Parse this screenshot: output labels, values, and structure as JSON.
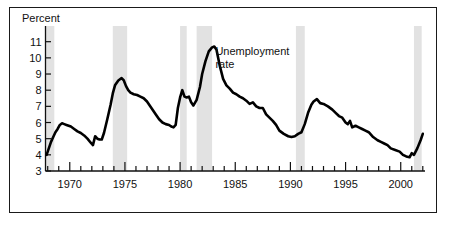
{
  "figure": {
    "background_color": "#ffffff",
    "frame_color": "#1a1a1a"
  },
  "chart_data": {
    "type": "line",
    "title": "",
    "subtitle": "",
    "xlabel": "",
    "ylabel": "Percent",
    "ylabel_position": "top-left",
    "xlim": [
      1967.8,
      2002.2
    ],
    "ylim": [
      3,
      11.6
    ],
    "grid": false,
    "legend": "none",
    "line_color": "#000000",
    "line_width_px": 2.6,
    "yticks": [
      3,
      4,
      5,
      6,
      7,
      8,
      9,
      10,
      11
    ],
    "ytick_labels": [
      "3",
      "4",
      "5",
      "6",
      "7",
      "8",
      "9",
      "10",
      "11"
    ],
    "xtick_major": [
      1970,
      1975,
      1980,
      1985,
      1990,
      1995,
      2000
    ],
    "xtick_major_labels": [
      "1970",
      "1975",
      "1980",
      "1985",
      "1990",
      "1995",
      "2000"
    ],
    "xtick_minor_step": 1,
    "annotations": [
      {
        "name": "series-label",
        "lines": [
          "Unemployment",
          "rate"
        ],
        "x_year": 1983.2,
        "y_percent": 10.2
      }
    ],
    "shaded_bands": {
      "name": "recession-bands",
      "color": "#e2e2e2",
      "label": "recession",
      "ranges": [
        [
          1967.8,
          1968.6
        ],
        [
          1973.9,
          1975.2
        ],
        [
          1980.0,
          1980.6
        ],
        [
          1981.5,
          1982.9
        ],
        [
          1990.5,
          1991.3
        ],
        [
          2001.2,
          2001.9
        ]
      ]
    },
    "series": [
      {
        "name": "Unemployment rate",
        "units": "percent",
        "x": [
          1967.9,
          1968.1,
          1968.3,
          1968.5,
          1968.7,
          1968.9,
          1969.1,
          1969.3,
          1969.5,
          1969.7,
          1969.9,
          1970.1,
          1970.4,
          1970.7,
          1971.0,
          1971.3,
          1971.6,
          1971.9,
          1972.1,
          1972.3,
          1972.5,
          1972.7,
          1972.9,
          1973.1,
          1973.4,
          1973.7,
          1973.9,
          1974.1,
          1974.4,
          1974.7,
          1974.9,
          1975.1,
          1975.3,
          1975.5,
          1975.8,
          1976.1,
          1976.4,
          1976.7,
          1977.0,
          1977.4,
          1977.8,
          1978.1,
          1978.4,
          1978.7,
          1979.0,
          1979.2,
          1979.4,
          1979.6,
          1979.8,
          1980.0,
          1980.2,
          1980.4,
          1980.6,
          1980.8,
          1981.0,
          1981.2,
          1981.5,
          1981.8,
          1982.0,
          1982.3,
          1982.6,
          1982.9,
          1983.1,
          1983.3,
          1983.6,
          1983.9,
          1984.2,
          1984.5,
          1984.8,
          1985.1,
          1985.4,
          1985.7,
          1986.0,
          1986.3,
          1986.6,
          1986.9,
          1987.2,
          1987.5,
          1987.8,
          1988.1,
          1988.4,
          1988.7,
          1989.0,
          1989.4,
          1989.8,
          1990.1,
          1990.4,
          1990.7,
          1991.0,
          1991.3,
          1991.6,
          1991.9,
          1992.1,
          1992.4,
          1992.7,
          1993.0,
          1993.4,
          1993.8,
          1994.1,
          1994.4,
          1994.7,
          1995.0,
          1995.2,
          1995.4,
          1995.6,
          1995.9,
          1996.2,
          1996.5,
          1996.8,
          1997.1,
          1997.5,
          1997.9,
          1998.2,
          1998.5,
          1998.8,
          1999.1,
          1999.5,
          1999.9,
          2000.2,
          2000.5,
          2000.8,
          2001.0,
          2001.2,
          2001.5,
          2001.8,
          2002.0
        ],
        "y": [
          4.0,
          4.4,
          4.8,
          5.1,
          5.4,
          5.6,
          5.85,
          5.95,
          5.9,
          5.85,
          5.8,
          5.75,
          5.6,
          5.45,
          5.35,
          5.2,
          5.0,
          4.75,
          4.6,
          5.15,
          5.0,
          4.95,
          4.95,
          5.35,
          6.2,
          7.1,
          7.8,
          8.3,
          8.6,
          8.75,
          8.6,
          8.25,
          8.0,
          7.85,
          7.75,
          7.7,
          7.6,
          7.5,
          7.3,
          6.9,
          6.5,
          6.2,
          6.0,
          5.9,
          5.85,
          5.75,
          5.7,
          5.85,
          6.9,
          7.55,
          8.0,
          7.6,
          7.55,
          7.6,
          7.25,
          7.05,
          7.4,
          8.2,
          9.0,
          9.8,
          10.4,
          10.65,
          10.7,
          10.5,
          9.5,
          8.7,
          8.3,
          8.1,
          7.85,
          7.75,
          7.6,
          7.5,
          7.35,
          7.15,
          7.25,
          7.0,
          6.9,
          6.9,
          6.5,
          6.3,
          6.1,
          5.85,
          5.5,
          5.3,
          5.15,
          5.1,
          5.15,
          5.3,
          5.4,
          5.9,
          6.6,
          7.1,
          7.3,
          7.45,
          7.2,
          7.15,
          7.0,
          6.8,
          6.6,
          6.4,
          6.3,
          6.0,
          5.9,
          6.1,
          5.7,
          5.8,
          5.7,
          5.6,
          5.5,
          5.4,
          5.1,
          4.9,
          4.8,
          4.7,
          4.6,
          4.4,
          4.3,
          4.2,
          4.0,
          3.9,
          3.85,
          4.1,
          4.0,
          4.4,
          4.9,
          5.3
        ]
      }
    ]
  }
}
